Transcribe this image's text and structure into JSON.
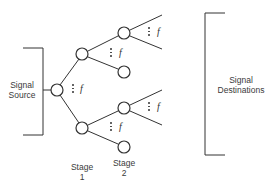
{
  "diagram": {
    "source_label_line1": "Signal",
    "source_label_line2": "Source",
    "destinations_label_line1": "Signal",
    "destinations_label_line2": "Destinations",
    "stages": [
      {
        "label_line1": "Stage",
        "label_line2": "1"
      },
      {
        "label_line1": "Stage",
        "label_line2": "2"
      }
    ],
    "fanout_symbol": "f",
    "fanout_marks": [
      {
        "id": "root",
        "label": "f"
      },
      {
        "id": "stage1-upper",
        "label": "f"
      },
      {
        "id": "stage1-lower",
        "label": "f"
      },
      {
        "id": "stage2-upper",
        "label": "f"
      },
      {
        "id": "stage2-lower",
        "label": "f"
      }
    ],
    "line_color": "#333333"
  }
}
